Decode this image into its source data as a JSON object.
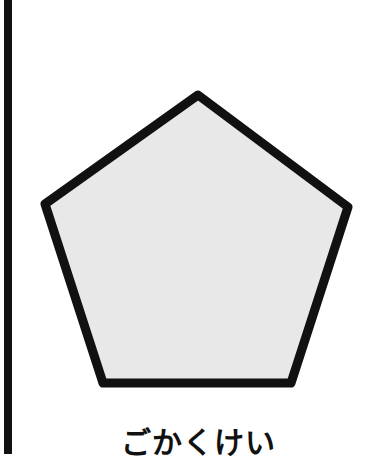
{
  "card": {
    "caption": "ごかくけい",
    "shape": {
      "name": "pentagon",
      "points": [
        [
          198,
          95
        ],
        [
          348,
          207
        ],
        [
          291,
          383
        ],
        [
          103,
          383
        ],
        [
          45,
          204
        ]
      ],
      "fill": "#e8e8e8",
      "stroke": "#111111",
      "stroke_width": 9
    },
    "left_border_color": "#111111"
  }
}
